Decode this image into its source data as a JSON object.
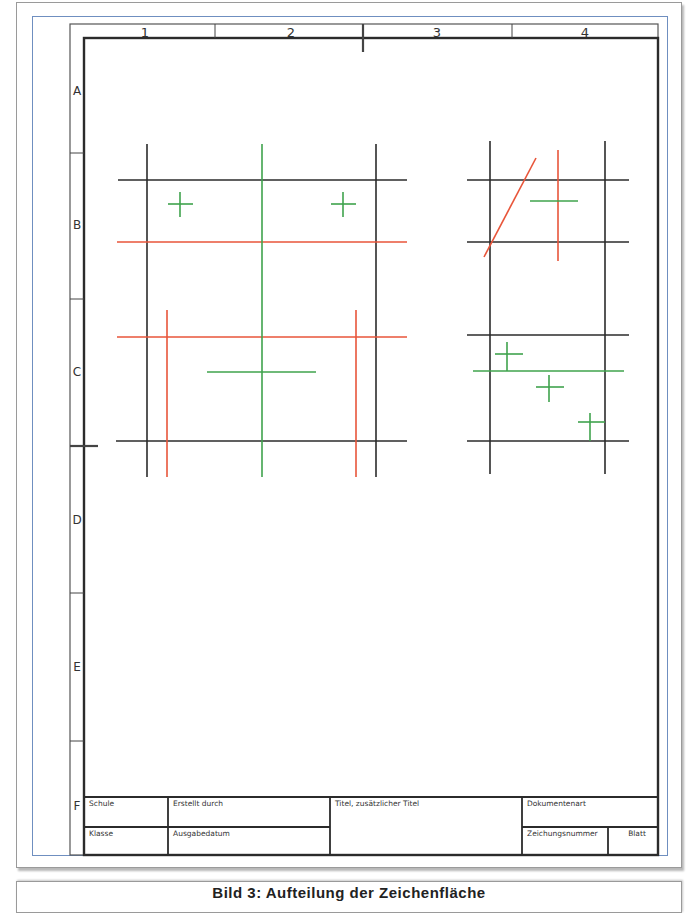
{
  "sheet": {
    "columns": [
      "1",
      "2",
      "3",
      "4"
    ],
    "rows": [
      "A",
      "B",
      "C",
      "D",
      "E",
      "F"
    ]
  },
  "title_block": {
    "school": "Schule",
    "created_by": "Erstellt durch",
    "title": "Titel, zusätzlicher Titel",
    "document_type": "Dokumentenart",
    "class": "Klasse",
    "issue_date": "Ausgabedatum",
    "drawing_number": "Zeichungsnummer",
    "sheet": "Blatt"
  },
  "caption": "Bild 3: Aufteilung der Zeichenfläche",
  "colors": {
    "outline": "#2b2b2b",
    "center_line": "#3fa34d",
    "hidden_line": "#e8553a",
    "frame_blue": "#6f8fc0"
  }
}
